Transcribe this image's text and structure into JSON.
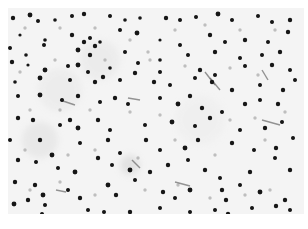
{
  "image": {
    "description": "Grayscale micrograph of tissue section with scattered dark stained nuclei",
    "background_color": "#f3f3f3",
    "nucleus_color": "#141414",
    "faint_color": "#9a9a9a",
    "streak_color": "#6a6a6a",
    "nuclei": [
      [
        13,
        18,
        2.2
      ],
      [
        30,
        15,
        2.4
      ],
      [
        38,
        21,
        2
      ],
      [
        55,
        20,
        1.8
      ],
      [
        72,
        16,
        2
      ],
      [
        84,
        14,
        2.2
      ],
      [
        110,
        16,
        2
      ],
      [
        125,
        20,
        1.8
      ],
      [
        140,
        18,
        1.8
      ],
      [
        166,
        18,
        2.2
      ],
      [
        180,
        20,
        2
      ],
      [
        196,
        17,
        2
      ],
      [
        218,
        14,
        2.4
      ],
      [
        232,
        20,
        2
      ],
      [
        258,
        16,
        2
      ],
      [
        272,
        22,
        2
      ],
      [
        290,
        20,
        2.2
      ],
      [
        20,
        35,
        1.6
      ],
      [
        45,
        40,
        1.8
      ],
      [
        72,
        35,
        2.2
      ],
      [
        90,
        38,
        2
      ],
      [
        100,
        42,
        1.8
      ],
      [
        120,
        30,
        2
      ],
      [
        137,
        33,
        2.4
      ],
      [
        160,
        40,
        1.6
      ],
      [
        180,
        45,
        2
      ],
      [
        210,
        35,
        2.2
      ],
      [
        225,
        42,
        2
      ],
      [
        245,
        40,
        2.2
      ],
      [
        268,
        42,
        2
      ],
      [
        288,
        32,
        2.2
      ],
      [
        10,
        48,
        2
      ],
      [
        26,
        55,
        1.8
      ],
      [
        44,
        45,
        2
      ],
      [
        78,
        50,
        2.4
      ],
      [
        84,
        42,
        2.2
      ],
      [
        95,
        46,
        2.2
      ],
      [
        90,
        55,
        2.2
      ],
      [
        125,
        52,
        2
      ],
      [
        138,
        63,
        2
      ],
      [
        160,
        60,
        1.8
      ],
      [
        188,
        55,
        2
      ],
      [
        215,
        52,
        2.2
      ],
      [
        240,
        58,
        2
      ],
      [
        262,
        55,
        2
      ],
      [
        280,
        52,
        2.2
      ],
      [
        12,
        62,
        2.2
      ],
      [
        28,
        65,
        1.6
      ],
      [
        45,
        70,
        2.4
      ],
      [
        68,
        66,
        2
      ],
      [
        78,
        65,
        2.4
      ],
      [
        88,
        72,
        2
      ],
      [
        110,
        68,
        1.8
      ],
      [
        135,
        73,
        2.2
      ],
      [
        160,
        72,
        2
      ],
      [
        200,
        70,
        2.2
      ],
      [
        215,
        75,
        2
      ],
      [
        245,
        66,
        2
      ],
      [
        272,
        65,
        2.2
      ],
      [
        290,
        70,
        2
      ],
      [
        15,
        82,
        1.8
      ],
      [
        40,
        78,
        2.4
      ],
      [
        70,
        80,
        2
      ],
      [
        95,
        82,
        2.2
      ],
      [
        103,
        77,
        2.2
      ],
      [
        120,
        80,
        2
      ],
      [
        154,
        82,
        2.2
      ],
      [
        170,
        85,
        2
      ],
      [
        195,
        78,
        2
      ],
      [
        212,
        82,
        2.2
      ],
      [
        232,
        90,
        2.2
      ],
      [
        260,
        85,
        2
      ],
      [
        283,
        90,
        2.2
      ],
      [
        295,
        80,
        2
      ],
      [
        18,
        96,
        2
      ],
      [
        40,
        95,
        2.4
      ],
      [
        62,
        100,
        2
      ],
      [
        78,
        96,
        2.2
      ],
      [
        100,
        102,
        2
      ],
      [
        115,
        98,
        2.2
      ],
      [
        128,
        104,
        2
      ],
      [
        160,
        98,
        2
      ],
      [
        178,
        104,
        2.4
      ],
      [
        190,
        96,
        2.2
      ],
      [
        202,
        108,
        2.2
      ],
      [
        222,
        112,
        2
      ],
      [
        245,
        104,
        2.2
      ],
      [
        260,
        100,
        2
      ],
      [
        278,
        104,
        2.2
      ],
      [
        18,
        118,
        2.2
      ],
      [
        33,
        120,
        2.2
      ],
      [
        60,
        125,
        2
      ],
      [
        78,
        128,
        2.4
      ],
      [
        70,
        120,
        2.2
      ],
      [
        98,
        120,
        2.2
      ],
      [
        110,
        130,
        2
      ],
      [
        145,
        125,
        2
      ],
      [
        172,
        122,
        2.4
      ],
      [
        195,
        126,
        2
      ],
      [
        210,
        118,
        2.2
      ],
      [
        240,
        130,
        2
      ],
      [
        265,
        128,
        2.2
      ],
      [
        282,
        122,
        2
      ],
      [
        10,
        140,
        2
      ],
      [
        40,
        140,
        2.2
      ],
      [
        52,
        155,
        2.4
      ],
      [
        80,
        143,
        2
      ],
      [
        108,
        140,
        2.2
      ],
      [
        120,
        153,
        2
      ],
      [
        146,
        140,
        2.2
      ],
      [
        160,
        150,
        2
      ],
      [
        185,
        148,
        2.4
      ],
      [
        198,
        140,
        2.2
      ],
      [
        232,
        143,
        2.2
      ],
      [
        254,
        150,
        2
      ],
      [
        276,
        148,
        2.2
      ],
      [
        293,
        138,
        2
      ],
      [
        18,
        160,
        2.2
      ],
      [
        36,
        162,
        2
      ],
      [
        58,
        168,
        2
      ],
      [
        75,
        172,
        2.4
      ],
      [
        98,
        158,
        2.2
      ],
      [
        112,
        165,
        2
      ],
      [
        130,
        170,
        2.4
      ],
      [
        150,
        172,
        2.2
      ],
      [
        168,
        165,
        2.2
      ],
      [
        188,
        160,
        2
      ],
      [
        205,
        170,
        2.2
      ],
      [
        220,
        178,
        2
      ],
      [
        250,
        172,
        2.2
      ],
      [
        275,
        158,
        2
      ],
      [
        290,
        170,
        2.2
      ],
      [
        15,
        182,
        2.2
      ],
      [
        35,
        185,
        2.2
      ],
      [
        43,
        195,
        2.4
      ],
      [
        45,
        205,
        2
      ],
      [
        68,
        190,
        2
      ],
      [
        80,
        198,
        2.2
      ],
      [
        108,
        185,
        2.4
      ],
      [
        116,
        195,
        2.2
      ],
      [
        135,
        180,
        2
      ],
      [
        163,
        192,
        2.2
      ],
      [
        175,
        198,
        2
      ],
      [
        190,
        190,
        2.4
      ],
      [
        222,
        190,
        2.2
      ],
      [
        226,
        200,
        2.2
      ],
      [
        240,
        185,
        2
      ],
      [
        260,
        192,
        2.4
      ],
      [
        285,
        200,
        2.2
      ],
      [
        14,
        204,
        2.4
      ],
      [
        28,
        200,
        2.2
      ],
      [
        42,
        214,
        2
      ],
      [
        88,
        210,
        2
      ],
      [
        104,
        212,
        2
      ],
      [
        130,
        212,
        2.2
      ],
      [
        160,
        208,
        2
      ],
      [
        190,
        212,
        2
      ],
      [
        215,
        210,
        2
      ],
      [
        228,
        214,
        2.2
      ],
      [
        252,
        208,
        2
      ],
      [
        276,
        206,
        2.2
      ],
      [
        290,
        210,
        2
      ]
    ],
    "faint_cells": [
      [
        25,
        28
      ],
      [
        60,
        28
      ],
      [
        95,
        28
      ],
      [
        130,
        40
      ],
      [
        148,
        52
      ],
      [
        175,
        30
      ],
      [
        205,
        25
      ],
      [
        240,
        30
      ],
      [
        275,
        30
      ],
      [
        20,
        72
      ],
      [
        55,
        60
      ],
      [
        105,
        60
      ],
      [
        150,
        60
      ],
      [
        185,
        66
      ],
      [
        230,
        68
      ],
      [
        258,
        75
      ],
      [
        30,
        110
      ],
      [
        60,
        110
      ],
      [
        90,
        110
      ],
      [
        130,
        112
      ],
      [
        160,
        115
      ],
      [
        230,
        120
      ],
      [
        255,
        118
      ],
      [
        285,
        112
      ],
      [
        25,
        150
      ],
      [
        68,
        155
      ],
      [
        95,
        150
      ],
      [
        138,
        158
      ],
      [
        175,
        140
      ],
      [
        215,
        155
      ],
      [
        265,
        140
      ],
      [
        30,
        190
      ],
      [
        60,
        182
      ],
      [
        95,
        195
      ],
      [
        145,
        190
      ],
      [
        178,
        185
      ],
      [
        210,
        198
      ],
      [
        245,
        195
      ],
      [
        270,
        190
      ]
    ],
    "streaks": [
      [
        205,
        72,
        215,
        85
      ],
      [
        210,
        78,
        220,
        90
      ],
      [
        262,
        70,
        268,
        80
      ],
      [
        60,
        100,
        75,
        105
      ],
      [
        128,
        98,
        140,
        100
      ],
      [
        262,
        120,
        280,
        125
      ],
      [
        132,
        160,
        140,
        168
      ],
      [
        175,
        182,
        190,
        186
      ],
      [
        56,
        190,
        66,
        192
      ]
    ]
  }
}
